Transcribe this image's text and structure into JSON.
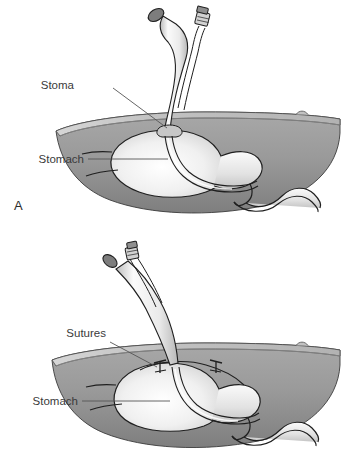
{
  "figure": {
    "background_color": "#ffffff",
    "ink_color": "#2b2b2b",
    "panels": [
      {
        "id": "A",
        "letter": "A",
        "labels": [
          {
            "id": "stoma",
            "text": "Stoma"
          },
          {
            "id": "stomach",
            "text": "Stomach"
          }
        ],
        "anatomy": [
          "abdominal-wall",
          "skin-surface",
          "umbilicus",
          "stomach",
          "duodenum",
          "gastrostomy-tube",
          "tube-open-end",
          "tube-capped-port"
        ]
      },
      {
        "id": "B",
        "letter": "B",
        "labels": [
          {
            "id": "sutures",
            "text": "Sutures"
          },
          {
            "id": "stomach",
            "text": "Stomach"
          }
        ],
        "anatomy": [
          "abdominal-wall",
          "skin-surface",
          "umbilicus",
          "stomach",
          "duodenum",
          "gastrostomy-tube",
          "tube-open-end",
          "tube-capped-port",
          "suture-left",
          "suture-right"
        ]
      }
    ],
    "colors": {
      "abdominal_wall_fill": "#9a9a9a",
      "abdominal_wall_dark": "#828282",
      "skin_band_fill": "#c9c9c9",
      "stomach_fill": "#f2f2f2",
      "stomach_highlight": "#ffffff",
      "tube_fill": "#ededed",
      "outline": "#1a1a1a",
      "leader_line": "#555555",
      "text": "#3a3a3a"
    }
  }
}
